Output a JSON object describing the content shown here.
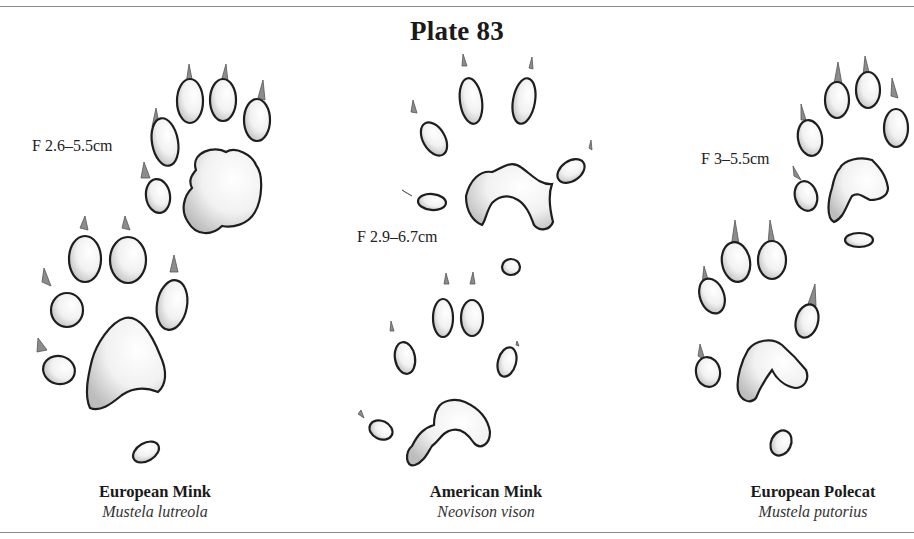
{
  "plate": {
    "title": "Plate 83"
  },
  "tracks": [
    {
      "id": "european-mink",
      "measurement": "F 2.6–5.5cm",
      "common_name": "European Mink",
      "latin_name": "Mustela lutreola"
    },
    {
      "id": "american-mink",
      "measurement": "F 2.9–6.7cm",
      "common_name": "American Mink",
      "latin_name": "Neovison vison"
    },
    {
      "id": "european-polecat",
      "measurement": "F 3–5.5cm",
      "common_name": "European Polecat",
      "latin_name": "Mustela putorius"
    }
  ],
  "colors": {
    "rule": "#8a8a8a",
    "outline": "#1e1e1e",
    "claw": "#8c8c8c",
    "shade": "#d0d0d0"
  }
}
